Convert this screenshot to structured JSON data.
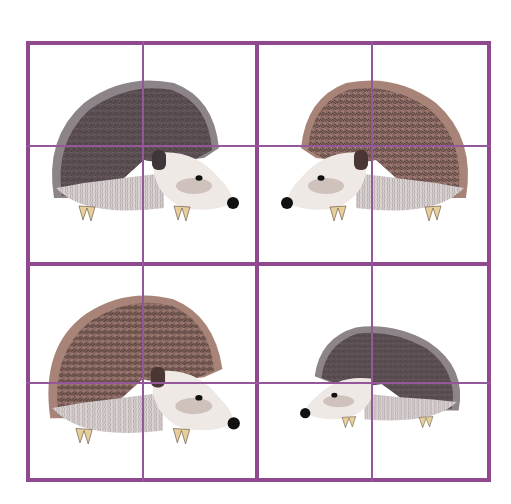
{
  "puzzle": {
    "grid": {
      "rows": 4,
      "cols": 4,
      "line_color": "#8e4a8c",
      "thin_line_color": "#94589a"
    },
    "panels": [
      {
        "id": "top-left",
        "subject": "hedgehog",
        "facing": "right",
        "tone": "gray"
      },
      {
        "id": "top-right",
        "subject": "hedgehog",
        "facing": "left",
        "tone": "brown"
      },
      {
        "id": "bottom-left",
        "subject": "hedgehog",
        "facing": "right",
        "tone": "brown"
      },
      {
        "id": "bottom-right",
        "subject": "hedgehog",
        "facing": "left",
        "tone": "gray"
      }
    ],
    "colors": {
      "spines_gray": "#5e5155",
      "spines_gray_edge": "#8c8489",
      "spines_brown": "#7a5e58",
      "spines_brown_light": "#a88478",
      "face": "#efe9e6",
      "face_shade": "#cfc2bd",
      "nose": "#111111",
      "claws": "#e6cf9a"
    }
  }
}
